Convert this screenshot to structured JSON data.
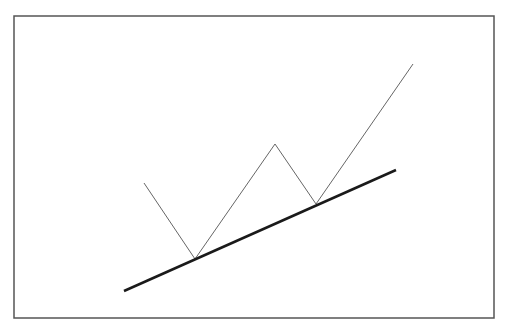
{
  "diagram": {
    "type": "price-trendline-illustration",
    "frame": {
      "x": 14,
      "y": 16,
      "width": 480,
      "height": 302,
      "stroke": "#555555"
    },
    "price_path": {
      "stroke": "#666666",
      "stroke_width": 1,
      "points": [
        [
          144,
          183
        ],
        [
          195,
          259
        ],
        [
          275,
          144
        ],
        [
          316,
          204
        ],
        [
          413,
          64
        ]
      ]
    },
    "trendline": {
      "label": "support-trendline",
      "stroke": "#1a1a1a",
      "stroke_width": 2.5,
      "start": [
        124,
        291
      ],
      "end": [
        396,
        170
      ]
    },
    "touch_points": [
      [
        195,
        259
      ],
      [
        316,
        204
      ]
    ]
  }
}
